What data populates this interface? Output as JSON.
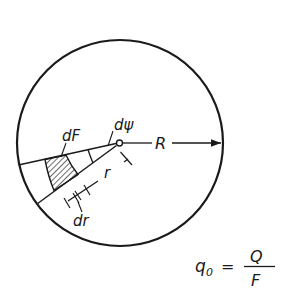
{
  "figure": {
    "type": "circular-plate-element-diagram",
    "labels": {
      "area_element": "dF",
      "angle_element": "dψ",
      "radius": "R",
      "radial_distance": "r",
      "radial_increment": "dr"
    },
    "formula": {
      "lhs": "q",
      "lhs_subscript": "0",
      "equals": "=",
      "numerator": "Q",
      "denominator": "F"
    }
  }
}
